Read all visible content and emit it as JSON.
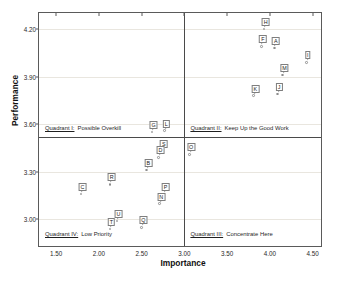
{
  "chart_data": {
    "type": "scatter",
    "title": "",
    "xlabel": "Importance",
    "ylabel": "Performance",
    "xlim": [
      1.3,
      4.62
    ],
    "ylim": [
      2.82,
      4.3
    ],
    "xticks": [
      "1.50",
      "2.00",
      "2.50",
      "3.00",
      "3.50",
      "4.00",
      "4.50"
    ],
    "xtick_values": [
      1.5,
      2.0,
      2.5,
      3.0,
      3.5,
      4.0,
      4.5
    ],
    "yticks": [
      "4.20",
      "3.90",
      "3.60",
      "3.30",
      "3.00"
    ],
    "ytick_values": [
      4.2,
      3.9,
      3.6,
      3.3,
      3.0
    ],
    "grid": "horizontal-faint",
    "legend": "none",
    "crosshair": {
      "x": 3.0,
      "y": 3.52
    },
    "points": [
      {
        "label": "H",
        "x": 3.93,
        "y": 4.2
      },
      {
        "label": "F",
        "x": 3.9,
        "y": 4.09
      },
      {
        "label": "A",
        "x": 4.05,
        "y": 4.08
      },
      {
        "label": "I",
        "x": 4.43,
        "y": 3.99
      },
      {
        "label": "M",
        "x": 4.15,
        "y": 3.91
      },
      {
        "label": "J",
        "x": 4.09,
        "y": 3.79
      },
      {
        "label": "K",
        "x": 3.81,
        "y": 3.78
      },
      {
        "label": "G",
        "x": 2.62,
        "y": 3.55
      },
      {
        "label": "L",
        "x": 2.77,
        "y": 3.56
      },
      {
        "label": "S",
        "x": 2.74,
        "y": 3.43
      },
      {
        "label": "O",
        "x": 3.06,
        "y": 3.41
      },
      {
        "label": "D",
        "x": 2.7,
        "y": 3.39
      },
      {
        "label": "B",
        "x": 2.56,
        "y": 3.31
      },
      {
        "label": "R",
        "x": 2.13,
        "y": 3.22
      },
      {
        "label": "C",
        "x": 1.79,
        "y": 3.16
      },
      {
        "label": "P",
        "x": 2.76,
        "y": 3.16
      },
      {
        "label": "N",
        "x": 2.71,
        "y": 3.1
      },
      {
        "label": "U",
        "x": 2.21,
        "y": 2.99
      },
      {
        "label": "T",
        "x": 2.13,
        "y": 2.94
      },
      {
        "label": "Q",
        "x": 2.5,
        "y": 2.95
      }
    ],
    "quadrants": [
      {
        "id": "q1",
        "name": "Quadrant I",
        "desc": "Possible Overkill"
      },
      {
        "id": "q2",
        "name": "Quadrant II",
        "desc": "Keep Up the Good Work"
      },
      {
        "id": "q3",
        "name": "Quadrant III",
        "desc": "Concentrate Here"
      },
      {
        "id": "q4",
        "name": "Quadrant IV",
        "desc": "Low Priority"
      }
    ]
  },
  "caption": ""
}
